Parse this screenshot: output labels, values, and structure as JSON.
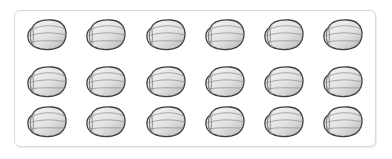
{
  "illustration": {
    "description": "Grid of seeds inside a rounded frame",
    "rows": 3,
    "columns": 6,
    "count": 18,
    "colors": {
      "frame_border": "#d9d9d9",
      "seed_outline": "#4a4a4a",
      "seed_fill_light": "#f4f4f4",
      "seed_fill_dark": "#bdbdbd",
      "seed_ridge": "#8a8a8a"
    },
    "column_x": [
      26,
      85,
      145,
      204,
      263,
      322
    ],
    "row_y": [
      18,
      65,
      105
    ]
  }
}
